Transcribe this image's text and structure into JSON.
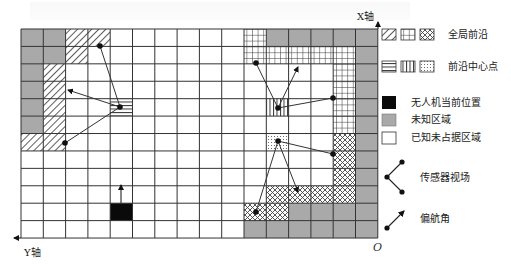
{
  "figure": {
    "grid": {
      "cols": 16,
      "rows": 12,
      "left": 21,
      "top": 29,
      "cell_w": 22.3,
      "cell_h": 17.42
    },
    "colors": {
      "unknown": "#a9a9a9",
      "drone": "#0a0a0a",
      "line": "#333333",
      "known_empty": "#ffffff"
    },
    "cells": {
      "unknown": [
        [
          0,
          0
        ],
        [
          0,
          1
        ],
        [
          1,
          0
        ],
        [
          1,
          1
        ],
        [
          2,
          0
        ],
        [
          3,
          0
        ],
        [
          4,
          0
        ],
        [
          5,
          0
        ],
        [
          0,
          11
        ],
        [
          0,
          12
        ],
        [
          0,
          13
        ],
        [
          0,
          14
        ],
        [
          0,
          15
        ],
        [
          1,
          15
        ],
        [
          2,
          15
        ],
        [
          3,
          15
        ],
        [
          4,
          15
        ],
        [
          5,
          15
        ],
        [
          6,
          15
        ],
        [
          7,
          15
        ],
        [
          8,
          15
        ],
        [
          9,
          15
        ],
        [
          10,
          12
        ],
        [
          10,
          13
        ],
        [
          10,
          14
        ],
        [
          10,
          15
        ],
        [
          11,
          10
        ],
        [
          11,
          11
        ],
        [
          11,
          12
        ],
        [
          11,
          13
        ],
        [
          11,
          14
        ],
        [
          11,
          15
        ]
      ],
      "frontier_diag": [
        [
          0,
          2
        ],
        [
          0,
          3
        ],
        [
          1,
          2
        ],
        [
          2,
          1
        ],
        [
          3,
          1
        ],
        [
          4,
          1
        ],
        [
          5,
          1
        ],
        [
          6,
          0
        ],
        [
          6,
          1
        ]
      ],
      "frontier_grid": [
        [
          0,
          10
        ],
        [
          1,
          10
        ],
        [
          1,
          11
        ],
        [
          1,
          12
        ],
        [
          1,
          13
        ],
        [
          1,
          14
        ],
        [
          2,
          14
        ],
        [
          3,
          14
        ],
        [
          4,
          14
        ],
        [
          5,
          14
        ]
      ],
      "frontier_cross": [
        [
          6,
          14
        ],
        [
          7,
          14
        ],
        [
          8,
          14
        ],
        [
          9,
          11
        ],
        [
          9,
          12
        ],
        [
          9,
          13
        ],
        [
          9,
          14
        ],
        [
          10,
          10
        ],
        [
          10,
          11
        ]
      ],
      "center_hstripe": [
        [
          4,
          4
        ]
      ],
      "center_vstripe": [
        [
          4,
          11
        ]
      ],
      "center_dots": [
        [
          6,
          11
        ]
      ],
      "drone": [
        [
          10,
          4
        ]
      ]
    },
    "sensor_fovs": [
      {
        "apex": [
          120,
          107
        ],
        "ends": [
          [
            100,
            46
          ],
          [
            65,
            143
          ]
        ],
        "yaw_tip": [
          68,
          90
        ]
      },
      {
        "apex": [
          278,
          108
        ],
        "ends": [
          [
            256,
            63
          ],
          [
            333,
            98
          ]
        ],
        "yaw_tip": [
          298,
          67
        ]
      },
      {
        "apex": [
          278,
          141
        ],
        "ends": [
          [
            333,
            154
          ],
          [
            256,
            212
          ]
        ],
        "yaw_tip": [
          298,
          192
        ]
      }
    ],
    "drone_heading": {
      "from": [
        121,
        203
      ],
      "to": [
        121,
        185
      ]
    },
    "axes": {
      "x_label": "X轴",
      "y_label": "Y轴",
      "origin_label": "O"
    }
  },
  "legend": {
    "global_frontier": "全局前沿",
    "frontier_center": "前沿中心点",
    "drone_position": "无人机当前位置",
    "unknown_area": "未知区域",
    "known_unoccupied": "已知未占据区域",
    "sensor_fov": "传感器视场",
    "yaw_angle": "偏航角"
  }
}
